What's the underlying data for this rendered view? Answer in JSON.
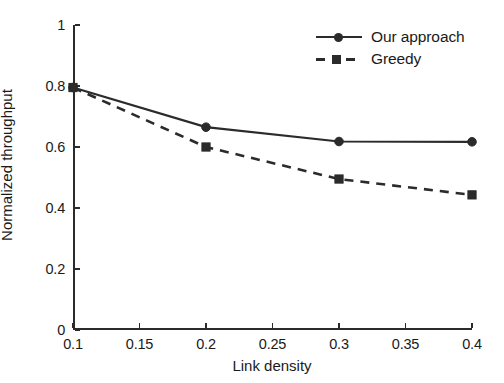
{
  "chart_data": {
    "type": "line",
    "title": "",
    "xlabel": "Link density",
    "ylabel": "Normalized throughput",
    "xlim": [
      0.1,
      0.4
    ],
    "ylim": [
      0,
      1
    ],
    "grid": false,
    "legend_position": "top-right",
    "xticks": [
      "0.1",
      "0.15",
      "0.2",
      "0.25",
      "0.3",
      "0.35",
      "0.4"
    ],
    "xtick_values": [
      0.1,
      0.15,
      0.2,
      0.25,
      0.3,
      0.35,
      0.4
    ],
    "yticks": [
      "0",
      "0.2",
      "0.4",
      "0.6",
      "0.8",
      "1"
    ],
    "ytick_values": [
      0,
      0.2,
      0.4,
      0.6,
      0.8,
      1
    ],
    "x": [
      0.1,
      0.2,
      0.3,
      0.4
    ],
    "series": [
      {
        "name": "Our approach",
        "values": [
          0.795,
          0.665,
          0.618,
          0.617
        ],
        "line_style": "solid",
        "marker": "circle",
        "color": "#2b2b2b"
      },
      {
        "name": "Greedy",
        "values": [
          0.795,
          0.6,
          0.495,
          0.443
        ],
        "line_style": "dashed",
        "marker": "square",
        "color": "#2b2b2b"
      }
    ]
  },
  "legend": {
    "entries": [
      {
        "label": "Our approach",
        "marker": "circle-marker",
        "style": "solid"
      },
      {
        "label": "Greedy",
        "marker": "square-marker",
        "style": "dashed"
      }
    ]
  },
  "axes": {
    "x_title": "Link density",
    "y_title": "Normalized throughput",
    "x_tick_labels": [
      "0.1",
      "0.15",
      "0.2",
      "0.25",
      "0.3",
      "0.35",
      "0.4"
    ],
    "y_tick_labels": [
      "0",
      "0.2",
      "0.4",
      "0.6",
      "0.8",
      "1"
    ]
  }
}
